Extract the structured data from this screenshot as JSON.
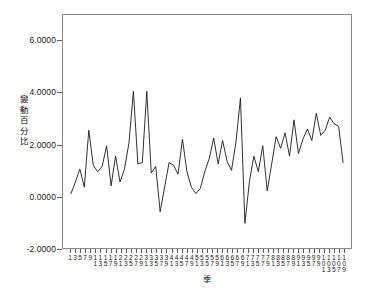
{
  "chart_data": {
    "type": "line",
    "title": "",
    "xlabel": "季",
    "ylabel": "變動百分比",
    "ylim": [
      -2.0,
      7.0
    ],
    "ytick_labels": [
      "6.0000",
      "4.0000",
      "2.0000",
      "0.0000",
      "-2.0000"
    ],
    "ytick_values": [
      6.0,
      4.0,
      2.0,
      0.0,
      -2.0
    ],
    "grid": false,
    "legend": false,
    "line_color": "#1a1a1a",
    "x_tick_rows": [
      "1 3 5 7 9 1 1 1 1 1 2 2 2 2 2 3 3 3 3 3 4 4 4 4 4 5 5 5 5 5 6 6 6 6 6 7 7 7 7 7 8 8 8 8 8 9 9 9 9 9 1 1 1 1 1",
      "1 3 5 7 9 1 1 3 5 7 9 1 3 5 7 9 1 3 5 7 9 1 3 5 7 9 1 3 5 7 9 1 3 5 7 9 1 3 5 7 9 1 3 5 7 9 1 3 5 7 9 0 0 0 0 0",
      "1 3 5 7 9 1"
    ],
    "x_row1": [
      "1",
      "3",
      "5",
      "7",
      "9",
      "1",
      "1",
      "1",
      "1",
      "1",
      "2",
      "2",
      "2",
      "2",
      "2",
      "3",
      "3",
      "3",
      "3",
      "3",
      "4",
      "4",
      "4",
      "4",
      "4",
      "5",
      "5",
      "5",
      "5",
      "5",
      "6",
      "6",
      "6",
      "6",
      "6",
      "7",
      "7",
      "7",
      "7",
      "7",
      "8",
      "8",
      "8",
      "8",
      "8",
      "9",
      "9",
      "9",
      "9",
      "9",
      "1",
      "1",
      "1",
      "1",
      "1"
    ],
    "x_row2": [
      "",
      "",
      "",
      "",
      "",
      "1",
      "3",
      "5",
      "7",
      "9",
      "1",
      "3",
      "5",
      "7",
      "9",
      "1",
      "3",
      "5",
      "7",
      "9",
      "1",
      "3",
      "5",
      "7",
      "9",
      "1",
      "3",
      "5",
      "7",
      "9",
      "1",
      "3",
      "5",
      "7",
      "9",
      "1",
      "3",
      "5",
      "7",
      "9",
      "1",
      "3",
      "5",
      "7",
      "9",
      "1",
      "3",
      "5",
      "7",
      "9",
      "0",
      "0",
      "0",
      "0",
      "0"
    ],
    "x_row3": [
      "",
      "",
      "",
      "",
      "",
      "",
      "",
      "",
      "",
      "",
      "",
      "",
      "",
      "",
      "",
      "",
      "",
      "",
      "",
      "",
      "",
      "",
      "",
      "",
      "",
      "",
      "",
      "",
      "",
      "",
      "",
      "",
      "",
      "",
      "",
      "",
      "",
      "",
      "",
      "",
      "",
      "",
      "",
      "",
      "",
      "",
      "",
      "",
      "",
      "",
      "1",
      "3",
      "5",
      "7",
      "9"
    ],
    "x_count": 55,
    "values": [
      0.1,
      1.05,
      0.35,
      2.55,
      1.15,
      1.95,
      0.4,
      1.55,
      0.95,
      2.05,
      4.05,
      1.25,
      1.3,
      4.05,
      0.9,
      -0.6,
      1.3,
      1.2,
      0.85,
      2.2,
      0.95,
      0.35,
      0.1,
      0.3,
      0.95,
      1.45,
      2.25,
      1.25,
      2.15,
      1.35,
      1.0,
      2.1,
      3.8,
      -1.05,
      1.55,
      0.95,
      1.95,
      0.2,
      1.25,
      2.3,
      1.85,
      2.45,
      1.55,
      2.95,
      1.65,
      2.2,
      2.6,
      2.15,
      3.2,
      2.35,
      2.55,
      3.05,
      2.8,
      2.7,
      1.3
    ],
    "points_detail": [
      0.1,
      0.55,
      1.05,
      0.35,
      2.55,
      1.2,
      0.95,
      1.15,
      1.95,
      0.4,
      1.55,
      0.55,
      1.05,
      2.05,
      4.05,
      1.25,
      1.3,
      4.05,
      0.9,
      1.15,
      -0.6,
      0.35,
      1.3,
      1.2,
      0.85,
      2.2,
      0.95,
      0.35,
      0.1,
      0.3,
      0.95,
      1.45,
      2.25,
      1.25,
      2.15,
      1.35,
      1.0,
      2.1,
      3.8,
      -1.05,
      0.55,
      1.55,
      0.95,
      1.95,
      0.2,
      1.25,
      2.3,
      1.85,
      2.45,
      1.55,
      2.95,
      1.65,
      2.2,
      2.6,
      2.15,
      3.2,
      2.35,
      2.55,
      3.05,
      2.8,
      2.7,
      1.3
    ]
  },
  "axis": {
    "y_title_chars": [
      "變",
      "動",
      "百",
      "分",
      "比"
    ],
    "x_title": "季"
  },
  "caption": {
    "text": ""
  }
}
